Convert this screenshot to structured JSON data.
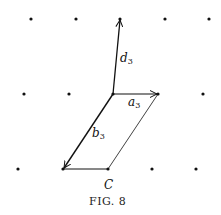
{
  "figure": {
    "caption": "Fig. 8",
    "caption_display": "FIG. 8"
  },
  "lattice_points": [
    {
      "x": 31,
      "y": 19
    },
    {
      "x": 76,
      "y": 19
    },
    {
      "x": 120,
      "y": 19
    },
    {
      "x": 165,
      "y": 19
    },
    {
      "x": 209,
      "y": 19
    },
    {
      "x": 24,
      "y": 94
    },
    {
      "x": 69,
      "y": 94
    },
    {
      "x": 113,
      "y": 94
    },
    {
      "x": 158,
      "y": 94
    },
    {
      "x": 203,
      "y": 94
    },
    {
      "x": 18,
      "y": 169
    },
    {
      "x": 63,
      "y": 169
    },
    {
      "x": 108,
      "y": 169
    },
    {
      "x": 152,
      "y": 169
    },
    {
      "x": 196,
      "y": 169
    }
  ],
  "vectors": [
    {
      "name": "d",
      "subscript": "3",
      "from": [
        113,
        94
      ],
      "to": [
        120,
        19
      ]
    },
    {
      "name": "a",
      "subscript": "3",
      "from": [
        113,
        94
      ],
      "to": [
        158,
        94
      ]
    },
    {
      "name": "b",
      "subscript": "3",
      "from": [
        113,
        94
      ],
      "to": [
        63,
        169
      ]
    }
  ],
  "labels": {
    "d3": {
      "main": "d",
      "sub": "3"
    },
    "a3": {
      "main": "a",
      "sub": "3"
    },
    "b3": {
      "main": "b",
      "sub": "3"
    },
    "c": "C"
  }
}
